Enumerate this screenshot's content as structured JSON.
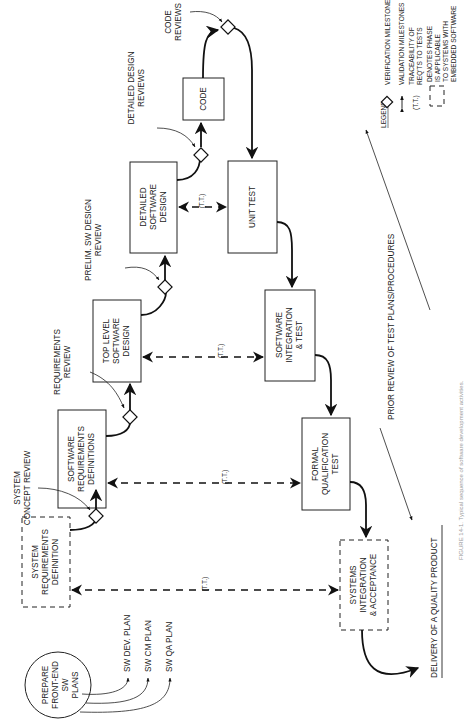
{
  "figure": {
    "caption": "FIGURE 14-1. Typical sequence of software development activities.",
    "orientation": "rotated 90° counter-clockwise"
  },
  "nodes": {
    "prepare_plans": [
      "PREPARE",
      "FRONT-END",
      "SW",
      "PLANS"
    ],
    "system_requirements_definition": [
      "SYSTEM",
      "REQUIREMENTS",
      "DEFINITION"
    ],
    "software_requirements_definitions": [
      "SOFTWARE",
      "REQUIREMENTS",
      "DEFINITIONS"
    ],
    "top_level_software_design": [
      "TOP LEVEL",
      "SOFTWARE",
      "DESIGN"
    ],
    "detailed_software_design": [
      "DETAILED",
      "SOFTWARE",
      "DESIGN"
    ],
    "code": [
      "CODE"
    ],
    "unit_test": [
      "UNIT TEST"
    ],
    "software_integration_test": [
      "SOFTWARE",
      "INTEGRATION",
      "& TEST"
    ],
    "formal_qualification_test": [
      "FORMAL",
      "QUALIFICATION",
      "TEST"
    ],
    "systems_integration_acceptance": [
      "SYSTEMS",
      "INTEGRATION",
      "& ACCEPTANCE"
    ]
  },
  "plans": [
    "SW DEV. PLAN",
    "SW CM PLAN",
    "SW QA PLAN"
  ],
  "reviews": {
    "system_concept": [
      "SYSTEM",
      "CONCEPT REVIEW"
    ],
    "requirements": [
      "REQUIREMENTS",
      "REVIEW"
    ],
    "prelim_design": [
      "PRELIM. SW DESIGN",
      "REVIEW"
    ],
    "detailed_design": [
      "DETAILED DESIGN",
      "REVIEWS"
    ],
    "code": [
      "CODE",
      "REVIEWS"
    ]
  },
  "traceability_label": "(T.T.)",
  "annotations": {
    "prior_review": "PRIOR REVIEW OF TEST PLANS/PROCEDURES",
    "delivery": "DELIVERY OF A QUALITY PRODUCT"
  },
  "legend": {
    "title": "LEGEND",
    "items": [
      {
        "symbol": "diamond",
        "label": "VERIFICATION MILESTONES"
      },
      {
        "symbol": "double-arrow",
        "label": "VALIDATION MILESTONES"
      },
      {
        "symbol": "(T.T.)",
        "label_lines": [
          "TRACEABILITY OF",
          "REQ'TS TO TESTS"
        ]
      },
      {
        "symbol": "dashed-box",
        "label_lines": [
          "DENOTES PHASE",
          "IS APPLICABLE",
          "TO SYSTEMS WITH",
          "EMBEDDED SOFTWARE"
        ]
      }
    ]
  }
}
